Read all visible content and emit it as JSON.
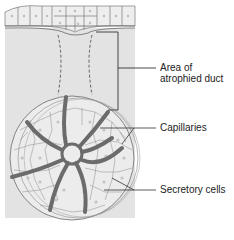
{
  "figure": {
    "type": "anatomical-diagram"
  },
  "labels": {
    "duct_line1": "Area of",
    "duct_line2": "atrophied duct",
    "capillaries": "Capillaries",
    "secretory": "Secretory cells"
  },
  "colors": {
    "background": "#ffffff",
    "tissue": "#e3e3e3",
    "cell_fill": "#ececec",
    "cell_outline": "#8a8a8a",
    "capillary": "#6b6b6b",
    "line": "#333333"
  }
}
